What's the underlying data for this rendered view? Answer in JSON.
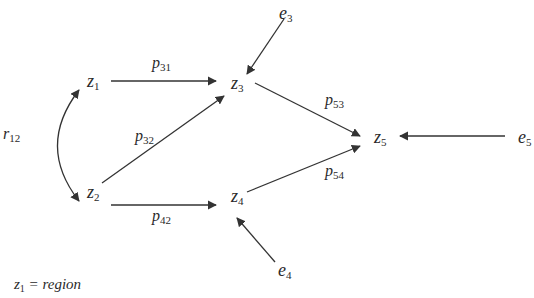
{
  "nodes": {
    "z1": {
      "base": "z",
      "sub": "1"
    },
    "z2": {
      "base": "z",
      "sub": "2"
    },
    "z3": {
      "base": "z",
      "sub": "3"
    },
    "z4": {
      "base": "z",
      "sub": "4"
    },
    "z5": {
      "base": "z",
      "sub": "5"
    },
    "e3": {
      "base": "e",
      "sub": "3"
    },
    "e4": {
      "base": "e",
      "sub": "4"
    },
    "e5": {
      "base": "e",
      "sub": "5"
    }
  },
  "paths": {
    "p31": {
      "base": "p",
      "sub": "31"
    },
    "p32": {
      "base": "p",
      "sub": "32"
    },
    "p42": {
      "base": "p",
      "sub": "42"
    },
    "p53": {
      "base": "p",
      "sub": "53"
    },
    "p54": {
      "base": "p",
      "sub": "54"
    },
    "r12": {
      "base": "r",
      "sub": "12"
    }
  },
  "edges": [
    {
      "from": "z1",
      "to": "z3",
      "label": "p31"
    },
    {
      "from": "z2",
      "to": "z3",
      "label": "p32"
    },
    {
      "from": "z2",
      "to": "z4",
      "label": "p42"
    },
    {
      "from": "z3",
      "to": "z5",
      "label": "p53"
    },
    {
      "from": "z4",
      "to": "z5",
      "label": "p54"
    },
    {
      "from": "e3",
      "to": "z3",
      "label": ""
    },
    {
      "from": "e4",
      "to": "z4",
      "label": ""
    },
    {
      "from": "e5",
      "to": "z5",
      "label": ""
    },
    {
      "from": "z1",
      "to": "z2",
      "label": "r12",
      "type": "correlation"
    }
  ],
  "legend": {
    "var": "z",
    "sub": "1",
    "text": " = region"
  },
  "colors": {
    "line": "#333333",
    "text": "#2a2a2a"
  }
}
